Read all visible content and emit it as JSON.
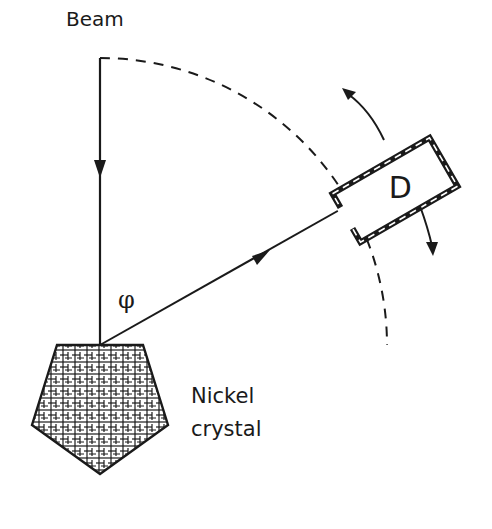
{
  "diagram": {
    "labels": {
      "beam": "Beam",
      "angle": "φ",
      "detector": "D",
      "crystal_line1": "Nickel",
      "crystal_line2": "crystal"
    },
    "colors": {
      "ink": "#1a1a1a",
      "background": "#ffffff"
    },
    "elements": [
      {
        "id": "incident-beam",
        "type": "arrow-line",
        "direction": "down"
      },
      {
        "id": "scattered-beam",
        "type": "arrow-line",
        "direction": "up-right"
      },
      {
        "id": "detector-path",
        "type": "dashed-arc"
      },
      {
        "id": "detector",
        "type": "rotated-box",
        "label": "D"
      },
      {
        "id": "rotation-arrows",
        "type": "curved-arrows",
        "count": 2
      },
      {
        "id": "nickel-crystal",
        "type": "hatched-pentagon"
      }
    ]
  }
}
